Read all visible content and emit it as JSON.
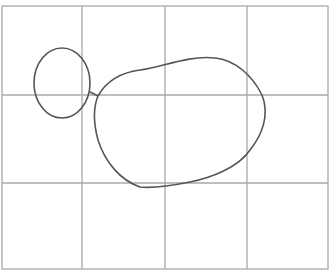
{
  "diagram": {
    "type": "grid-sketch",
    "grid": {
      "columns": 4,
      "rows": 3,
      "left": 2,
      "top": 6,
      "right": 328,
      "bottom": 269,
      "vertical_lines": [
        2,
        82,
        165,
        247,
        328
      ],
      "horizontal_lines": [
        6,
        95,
        183,
        269
      ],
      "line_color": "#a8a8a8"
    },
    "shapes": [
      {
        "name": "small-circle",
        "kind": "ellipse",
        "cx": 62,
        "cy": 83,
        "rx": 28,
        "ry": 35
      },
      {
        "name": "large-blob",
        "kind": "closed-curve"
      },
      {
        "name": "connector",
        "kind": "line",
        "x1": 90,
        "y1": 91,
        "x2": 98,
        "y2": 96
      }
    ],
    "stroke_color": "#555555"
  }
}
